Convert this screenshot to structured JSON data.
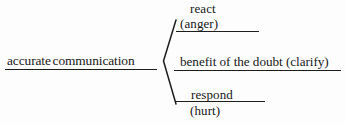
{
  "diagram": {
    "type": "bracket-tree",
    "orientation": "left-to-right",
    "root": {
      "label": "accurate communication",
      "underlined": true
    },
    "brace": {
      "glyph": "angle-bracket-left",
      "apex_side": "left",
      "branch_count": 3
    },
    "branches": [
      {
        "main": "react",
        "sub": "(anger)",
        "underlined": true,
        "position": "top"
      },
      {
        "main": "benefit of the doubt (clarify)",
        "sub": "",
        "underlined": true,
        "position": "middle"
      },
      {
        "main": "respond",
        "sub": "(hurt)",
        "underlined": true,
        "position": "bottom"
      }
    ]
  },
  "colors": {
    "ink": "#1d1d1d",
    "background": "#fdfdfd"
  }
}
